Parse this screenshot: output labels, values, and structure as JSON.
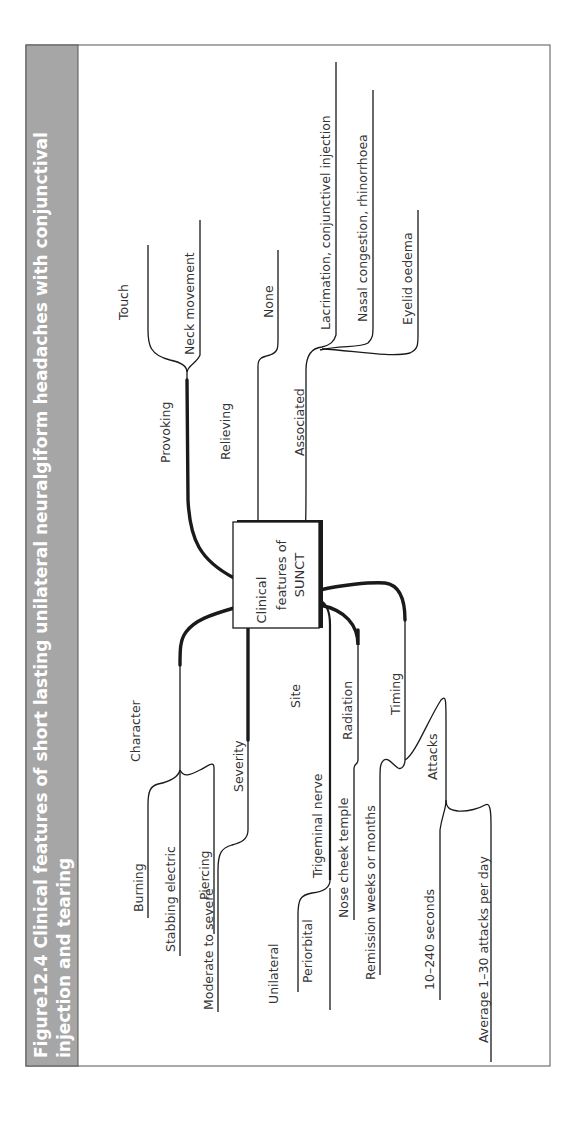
{
  "figure": {
    "title_line1": "Figure12.4  Clinical features of short lasting unilateral neuralgiform headaches with conjunctival",
    "title_line2": "injection and tearing",
    "orientation": "rotated 90° counter-clockwise",
    "colors": {
      "title_band": "#a6a6a6",
      "title_text": "#ffffff",
      "lines": "#1a1a1a",
      "labels": "#333333"
    }
  },
  "center": {
    "line1": "Clinical",
    "line2": "features of",
    "line3": "SUNCT"
  },
  "branches": {
    "provoking": {
      "label": "Provoking",
      "children": [
        "Touch",
        "Neck movement"
      ]
    },
    "relieving": {
      "label": "Relieving",
      "children": [
        "None"
      ]
    },
    "associated": {
      "label": "Associated",
      "children": [
        "Lacrimation, conjunctivel injection",
        "Nasal congestion, rhinorrhoea",
        "Eyelid oedema"
      ]
    },
    "character": {
      "label": "Character",
      "children": [
        "Burning",
        "Stabbing electric",
        "Piercing"
      ]
    },
    "severity": {
      "label": "Severity",
      "children": [
        "Moderate to severe"
      ]
    },
    "site": {
      "label": "Site",
      "sub": {
        "label": "Trigeminal nerve",
        "children": [
          "Unilateral",
          "Periorbital"
        ]
      }
    },
    "radiation": {
      "label": "Radiation",
      "children": [
        "Nose cheek temple"
      ]
    },
    "timing": {
      "label": "Timing",
      "children": [
        "Remission weeks or months"
      ],
      "sub": {
        "label": "Attacks",
        "children": [
          "10–240 seconds",
          "Average 1–30 attacks per day"
        ]
      }
    }
  }
}
